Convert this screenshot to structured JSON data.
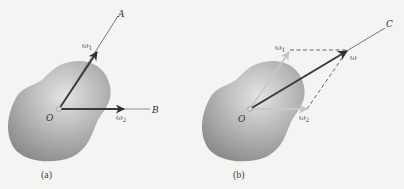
{
  "figure": {
    "panels": [
      {
        "id": "a",
        "caption": "(a)",
        "origin_label": "O",
        "axes": [
          {
            "label": "A"
          },
          {
            "label": "B"
          }
        ],
        "vectors": [
          {
            "symbol": "ω",
            "subscript": "1",
            "axis": "A"
          },
          {
            "symbol": "ω",
            "subscript": "2",
            "axis": "B"
          }
        ]
      },
      {
        "id": "b",
        "caption": "(b)",
        "origin_label": "O",
        "axes": [
          {
            "label": "C"
          }
        ],
        "vectors": [
          {
            "symbol": "ω",
            "subscript": "1"
          },
          {
            "symbol": "ω",
            "subscript": "2"
          },
          {
            "symbol": "ω",
            "subscript": "",
            "resultant": true
          }
        ]
      }
    ]
  },
  "colors": {
    "background": "#f4f4f2",
    "blob_dark": "#8f8f8f",
    "blob_light": "#e2e2e2",
    "vector_dark": "#3a3a3a",
    "vector_light": "#c8c8c8",
    "axis_line": "#555555",
    "dashed": "#444444"
  }
}
